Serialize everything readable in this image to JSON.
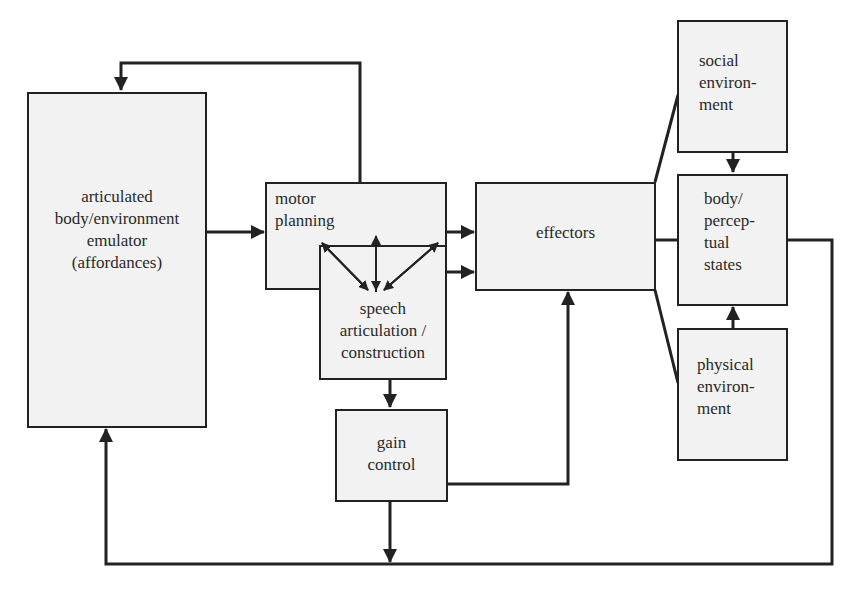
{
  "diagram": {
    "nodes": [
      {
        "id": "emulator",
        "label": "articulated\nbody/environment\nemulator\n(affordances)"
      },
      {
        "id": "motor_planning",
        "label": "motor\nplanning"
      },
      {
        "id": "speech",
        "label": "speech\narticulation /\nconstruction"
      },
      {
        "id": "gain_control",
        "label": "gain\ncontrol"
      },
      {
        "id": "effectors",
        "label": "effectors"
      },
      {
        "id": "social_env",
        "label": "social\nenviron-\nment"
      },
      {
        "id": "body_states",
        "label": "body/\npercep-\ntual\nstates"
      },
      {
        "id": "physical_env",
        "label": "physical\nenviron-\nment"
      }
    ],
    "edges": [
      {
        "from": "motor_planning",
        "to": "emulator",
        "route": "top loop"
      },
      {
        "from": "emulator",
        "to": "motor_planning"
      },
      {
        "from": "motor_planning",
        "to": "speech",
        "type": "bidirectional (3 arrows)"
      },
      {
        "from": "motor_planning",
        "to": "effectors"
      },
      {
        "from": "speech",
        "to": "effectors"
      },
      {
        "from": "speech",
        "to": "gain_control"
      },
      {
        "from": "gain_control",
        "to": "effectors"
      },
      {
        "from": "gain_control",
        "to": "bottom bus"
      },
      {
        "from": "effectors",
        "to": "social_env"
      },
      {
        "from": "effectors",
        "to": "body_states"
      },
      {
        "from": "effectors",
        "to": "physical_env"
      },
      {
        "from": "social_env",
        "to": "body_states"
      },
      {
        "from": "physical_env",
        "to": "body_states"
      },
      {
        "from": "body_states",
        "to": "emulator",
        "route": "right and bottom loop"
      }
    ],
    "colors": {
      "box_fill": "#f2f2f2",
      "stroke": "#222222"
    }
  }
}
